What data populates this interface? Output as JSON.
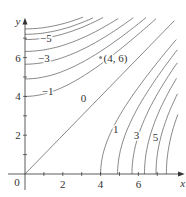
{
  "chart_data": {
    "type": "contour",
    "title": "",
    "xlabel": "x",
    "ylabel": "y",
    "xlim": [
      0,
      8
    ],
    "ylim": [
      0,
      8
    ],
    "x_ticks": [
      {
        "value": 2,
        "label": "2"
      },
      {
        "value": 4,
        "label": "4"
      },
      {
        "value": 6,
        "label": "6"
      }
    ],
    "x_minor_ticks": [
      1,
      3,
      5,
      7
    ],
    "y_ticks": [
      {
        "value": 2,
        "label": "2"
      },
      {
        "value": 4,
        "label": "4"
      },
      {
        "value": 6,
        "label": "6"
      }
    ],
    "y_minor_ticks": [
      1,
      3,
      5,
      7
    ],
    "origin_label": "0",
    "grid": false,
    "contours": {
      "zero_line": {
        "label": "0",
        "description": "y = x"
      },
      "positive_x_intercepts": [
        4.0,
        4.9,
        5.66,
        6.32,
        6.93,
        7.48
      ],
      "negative_y_intercepts": [
        4.0,
        4.9,
        5.66,
        6.32,
        6.93,
        7.2,
        7.48
      ],
      "positive_labels": [
        {
          "text": "1",
          "x": 4.8,
          "y": 2.3
        },
        {
          "text": "3",
          "x": 5.9,
          "y": 2.0
        },
        {
          "text": "5",
          "x": 6.9,
          "y": 1.9
        }
      ],
      "negative_labels": [
        {
          "text": "-1",
          "x": 1.2,
          "y": 4.3
        },
        {
          "text": "-3",
          "x": 1.0,
          "y": 6.0
        },
        {
          "text": "-5",
          "x": 1.1,
          "y": 7.0
        }
      ]
    },
    "annotations": [
      {
        "text": "(4, 6)",
        "x": 4,
        "y": 6,
        "marker": "dot"
      }
    ]
  }
}
